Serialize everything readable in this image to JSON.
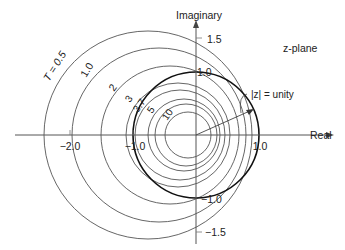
{
  "figure": {
    "plane_label": "z-plane",
    "axes": {
      "x_label": "Real",
      "y_label": "Imaginary",
      "x_ticks": [
        {
          "label": "−2.0",
          "value": -2.0
        },
        {
          "label": "−1.0",
          "value": -1.0
        },
        {
          "label": "1.0",
          "value": 1.0
        }
      ],
      "y_ticks": [
        {
          "label": "1.5",
          "value": 1.5
        },
        {
          "label": "1.0",
          "value": 1.0
        },
        {
          "label": "−1.0",
          "value": -1.0
        },
        {
          "label": "−1.5",
          "value": -1.5
        }
      ]
    },
    "unit_circle_label": "|z| = unity",
    "contours": [
      {
        "label": "T = 0.5",
        "cx": 148,
        "r": 104
      },
      {
        "label": "1.0",
        "cx": 159,
        "r": 87
      },
      {
        "label": "2",
        "cx": 170,
        "r": 69
      },
      {
        "label": "3",
        "cx": 178,
        "r": 52
      },
      {
        "label": "3.7",
        "cx": 180,
        "r": 45
      },
      {
        "label": "5",
        "cx": 184,
        "r": 36
      },
      {
        "label": "",
        "cx": 186,
        "r": 31
      },
      {
        "label": "10",
        "cx": 188,
        "r": 23
      }
    ]
  }
}
